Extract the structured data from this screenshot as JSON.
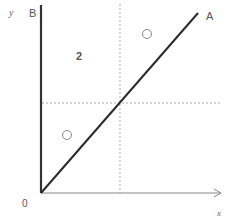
{
  "diagram": {
    "axis_labels": {
      "y": "y",
      "x": "x",
      "origin": "0"
    },
    "line_labels": {
      "vertical_axis_line": "B",
      "diagonal_line": "A"
    },
    "region_label": "2",
    "colors": {
      "axis": "#333333",
      "diagonal": "#2a2a2a",
      "dashed": "#aaaaaa",
      "circle": "#888888",
      "text": "#555555"
    },
    "markers": [
      {
        "shape": "circle",
        "region": "upper-right"
      },
      {
        "shape": "circle",
        "region": "lower-left"
      }
    ]
  }
}
